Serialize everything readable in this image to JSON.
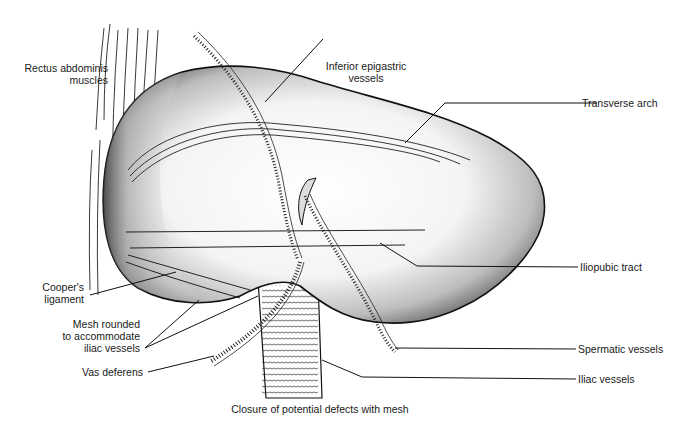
{
  "figure": {
    "caption": "Closure of potential defects with mesh",
    "colors": {
      "ink": "#111111",
      "background": "#ffffff",
      "shade_dark": "#3a3a3a",
      "shade_light": "#ffffff"
    }
  },
  "labels": {
    "rectus_abdominis": {
      "line1": "Rectus abdominis",
      "line2": "muscles"
    },
    "inferior_epigastric": {
      "line1": "Inferior epigastric",
      "line2": "vessels"
    },
    "transverse_arch": "Transverse arch",
    "coopers_ligament": {
      "line1": "Cooper's",
      "line2": "ligament"
    },
    "iliopubic_tract": "Iliopubic tract",
    "mesh_rounded": {
      "line1": "Mesh rounded",
      "line2": "to accommodate",
      "line3": "iliac vessels"
    },
    "spermatic_vessels": "Spermatic vessels",
    "vas_deferens": "Vas deferens",
    "iliac_vessels": "Iliac vessels"
  }
}
